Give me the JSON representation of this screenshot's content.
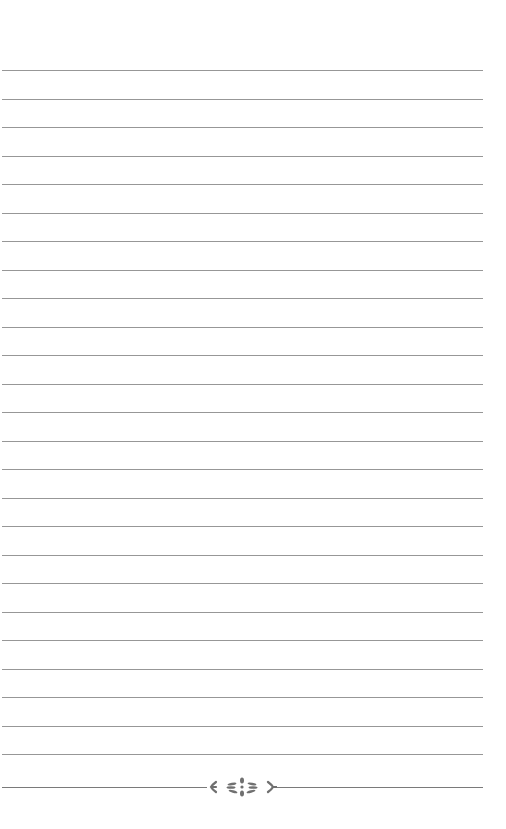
{
  "page": {
    "type": "lined-notebook-page",
    "background_color": "#ffffff",
    "line_color": "#8c8c8c",
    "ornament_color": "#707070",
    "line_count": 25,
    "first_line_y": 70,
    "line_spacing": 28.5,
    "line_left": 2,
    "line_width": 481
  },
  "footer_ornament": {
    "icon": "floral-divider-icon",
    "y": 787
  }
}
